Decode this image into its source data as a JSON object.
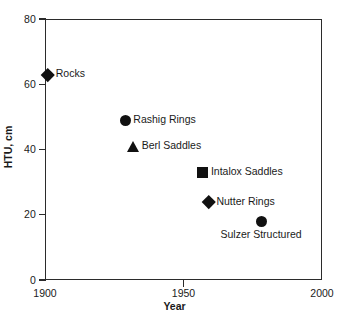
{
  "chart_data": {
    "type": "scatter",
    "title": "",
    "xlabel": "Year",
    "ylabel": "HTU, cm",
    "xlim": [
      1900,
      2000
    ],
    "ylim": [
      0,
      80
    ],
    "xticks": [
      "1900",
      "1950",
      "2000"
    ],
    "xtick_values": [
      1900,
      1950,
      2000
    ],
    "yticks": [
      "0",
      "20",
      "40",
      "60",
      "80"
    ],
    "ytick_values": [
      0,
      20,
      40,
      60,
      80
    ],
    "grid": false,
    "legend": "none (points labelled inline)",
    "marker_color": "#111111",
    "axis_color": "#2b2b2b",
    "points": [
      {
        "label": "Rocks",
        "x": 1901,
        "y": 63,
        "marker": "diamond",
        "label_position": "right"
      },
      {
        "label": "Rashig Rings",
        "x": 1929,
        "y": 49,
        "marker": "circle",
        "label_position": "right"
      },
      {
        "label": "Berl Saddles",
        "x": 1932,
        "y": 41,
        "marker": "triangle",
        "label_position": "right"
      },
      {
        "label": "Intalox Saddles",
        "x": 1957,
        "y": 33,
        "marker": "square",
        "label_position": "right"
      },
      {
        "label": "Nutter Rings",
        "x": 1959,
        "y": 24,
        "marker": "diamond",
        "label_position": "right"
      },
      {
        "label": "Sulzer Structured",
        "x": 1978,
        "y": 18,
        "marker": "circle",
        "label_position": "below"
      }
    ]
  }
}
